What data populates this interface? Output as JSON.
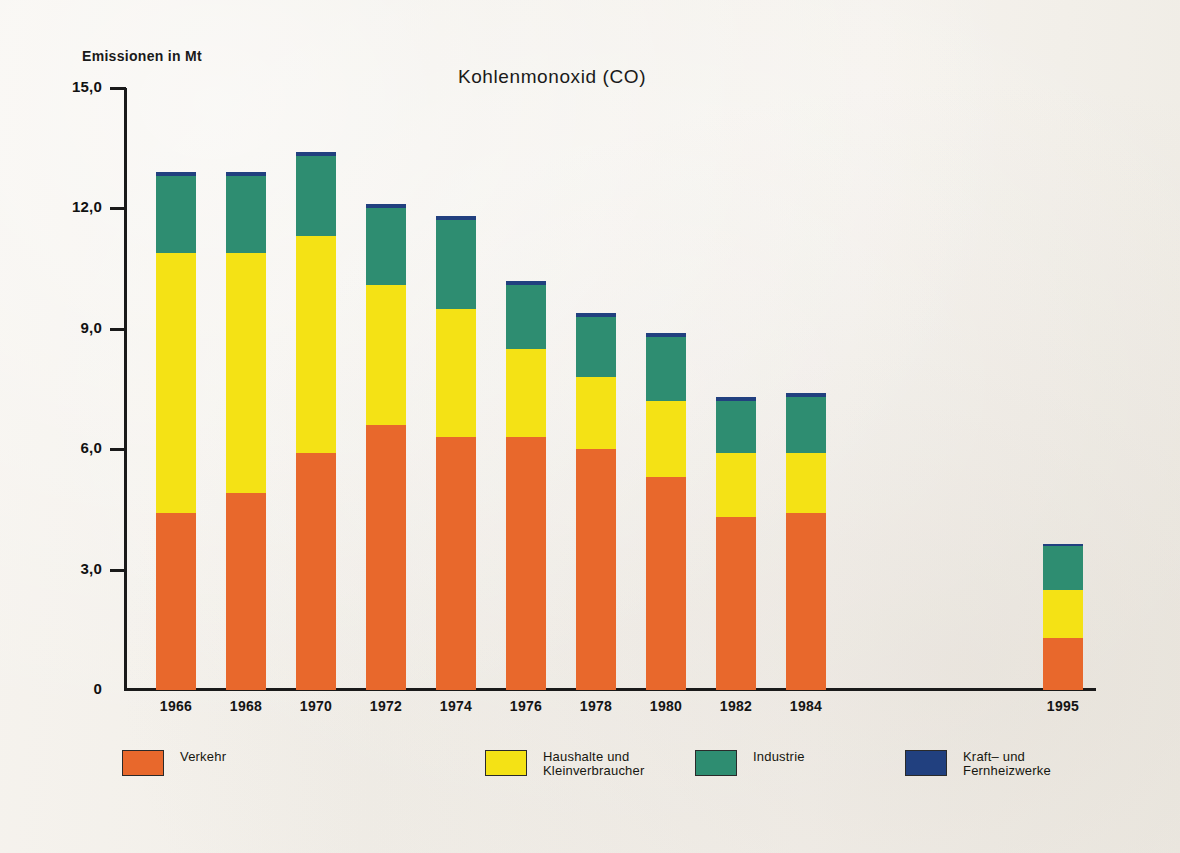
{
  "ghost_text": {
    "top": "",
    "bottom_left": "",
    "bottom_right": ""
  },
  "chart_data": {
    "type": "bar",
    "stacked": true,
    "title": "Kohlenmonoxid (CO)",
    "ylabel": "Emissionen in Mt",
    "xlabel": "",
    "ylim": [
      0,
      15
    ],
    "ytick_labels": [
      "15,0",
      "12,0",
      "9,0",
      "6,0",
      "3,0",
      "0"
    ],
    "ytick_values": [
      15.0,
      12.0,
      9.0,
      6.0,
      3.0,
      0
    ],
    "grid": false,
    "legend_position": "bottom",
    "categories": [
      "1966",
      "1968",
      "1970",
      "1972",
      "1974",
      "1976",
      "1978",
      "1980",
      "1982",
      "1984",
      "1995"
    ],
    "gap_after_category": "1984",
    "series": [
      {
        "name": "Verkehr",
        "color": "#e8682c",
        "values": [
          4.4,
          4.9,
          5.9,
          6.6,
          6.3,
          6.3,
          6.0,
          5.3,
          4.3,
          4.4,
          1.3
        ]
      },
      {
        "name": "Haushalte und Kleinverbraucher",
        "color": "#f4e215",
        "values": [
          6.5,
          6.0,
          5.4,
          3.5,
          3.2,
          2.2,
          1.8,
          1.9,
          1.6,
          1.5,
          1.2
        ]
      },
      {
        "name": "Industrie",
        "color": "#2e8d71",
        "values": [
          1.9,
          1.9,
          2.0,
          1.9,
          2.2,
          1.6,
          1.5,
          1.6,
          1.3,
          1.4,
          1.1
        ]
      },
      {
        "name": "Kraft- und Fernheizwerke",
        "color": "#21407f",
        "values": [
          0.1,
          0.1,
          0.1,
          0.1,
          0.1,
          0.1,
          0.1,
          0.1,
          0.1,
          0.1,
          0.05
        ]
      }
    ],
    "totals": [
      12.9,
      12.9,
      13.4,
      12.1,
      11.8,
      10.2,
      9.4,
      8.9,
      7.3,
      7.4,
      3.65
    ],
    "legend_entries": [
      {
        "label": "Verkehr",
        "label_line2": "",
        "color": "#e8682c"
      },
      {
        "label": "Haushalte und",
        "label_line2": "Kleinverbraucher",
        "color": "#f4e215"
      },
      {
        "label": "Industrie",
        "label_line2": "",
        "color": "#2e8d71"
      },
      {
        "label": "Kraft– und Fernheizwerke",
        "label_line2": "",
        "color": "#21407f"
      }
    ]
  }
}
